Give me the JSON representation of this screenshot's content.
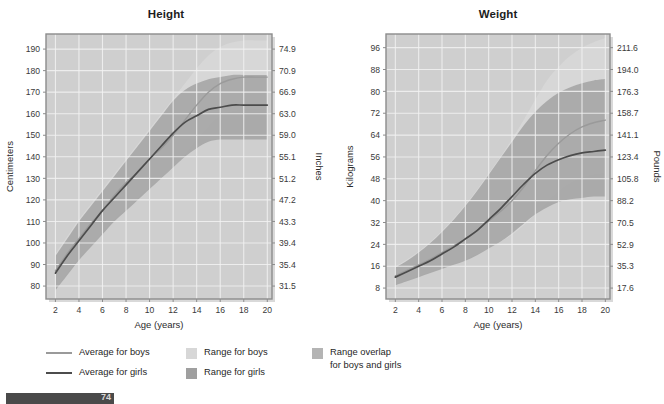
{
  "figure": {
    "background": "#ffffff",
    "plot_bg": "#cfcfcf",
    "grid_color": "#f2f2f2",
    "frame_color": "#8c8c8c",
    "boys_line_color": "#9a9a9a",
    "girls_line_color": "#4c4c4c",
    "boys_range_color": "#d7d7d7",
    "girls_range_color": "#9f9f9f",
    "overlap_color": "#b4b4b4"
  },
  "panels": [
    {
      "id": "height",
      "title": "Height",
      "x_label": "Age (years)",
      "y_left_label": "Centimeters",
      "y_right_label": "Inches"
    },
    {
      "id": "weight",
      "title": "Weight",
      "x_label": "Age (years)",
      "y_left_label": "Kilograms",
      "y_right_label": "Pounds"
    }
  ],
  "legend": {
    "lines": [
      {
        "label": "Average for boys",
        "color": "#9a9a9a",
        "marker": "line"
      },
      {
        "label": "Average for girls",
        "color": "#4c4c4c",
        "marker": "line"
      }
    ],
    "ranges": [
      {
        "label": "Range for boys",
        "color": "#d7d7d7",
        "marker": "box"
      },
      {
        "label": "Range for girls",
        "color": "#9f9f9f",
        "marker": "box"
      }
    ],
    "overlap": [
      {
        "label": "Range overlap\nfor boys and girls",
        "color": "#b4b4b4",
        "marker": "box"
      }
    ]
  },
  "footer": {
    "page_number": "74"
  },
  "chart_data": [
    {
      "type": "area",
      "id": "height",
      "title": "Height",
      "xlabel": "Age (years)",
      "ylabel": "Centimeters",
      "ylabel_right": "Inches",
      "grid": true,
      "legend_position": "below-figure",
      "xlim": [
        1.2,
        20.4
      ],
      "ylim": [
        74,
        197
      ],
      "x_ticks": [
        2,
        4,
        6,
        8,
        10,
        12,
        14,
        16,
        18,
        20
      ],
      "y_ticks_left": [
        80,
        90,
        100,
        110,
        120,
        130,
        140,
        150,
        160,
        170,
        180,
        190
      ],
      "y_ticks_right_values": [
        80,
        90,
        100,
        110,
        120,
        130,
        140,
        150,
        160,
        170,
        180,
        190
      ],
      "y_ticks_right_labels": [
        "31.5",
        "35.4",
        "39.4",
        "43.3",
        "47.2",
        "51.2",
        "55.1",
        "59.0",
        "63.0",
        "66.9",
        "70.9",
        "74.9"
      ],
      "x": [
        2,
        3,
        4,
        5,
        6,
        7,
        8,
        9,
        10,
        11,
        12,
        13,
        14,
        15,
        16,
        17,
        18,
        19,
        20
      ],
      "series": [
        {
          "name": "Average for boys",
          "kind": "line",
          "color": "#9a9a9a",
          "values": [
            87,
            95,
            102,
            109,
            115,
            122,
            128,
            133,
            139,
            144,
            150,
            157,
            164,
            170,
            174,
            176,
            177,
            177,
            177
          ]
        },
        {
          "name": "Average for girls",
          "kind": "line",
          "color": "#4c4c4c",
          "values": [
            86,
            94,
            101,
            108,
            115,
            121,
            127,
            133,
            139,
            145,
            151,
            156,
            159,
            162,
            163,
            164,
            164,
            164,
            164
          ]
        },
        {
          "name": "Range for boys",
          "kind": "band",
          "color": "#d7d7d7",
          "lower": [
            79,
            86,
            93,
            99,
            105,
            111,
            116,
            121,
            126,
            130,
            135,
            141,
            148,
            154,
            159,
            161,
            162,
            162,
            162
          ],
          "upper": [
            95,
            103,
            111,
            118,
            125,
            132,
            139,
            146,
            153,
            160,
            167,
            174,
            181,
            187,
            191,
            193,
            194,
            194,
            194
          ]
        },
        {
          "name": "Range for girls",
          "kind": "band",
          "color": "#9f9f9f",
          "lower": [
            78,
            85,
            92,
            98,
            104,
            110,
            115,
            120,
            125,
            130,
            135,
            140,
            144,
            147,
            148,
            148,
            148,
            148,
            148
          ],
          "upper": [
            94,
            102,
            110,
            117,
            124,
            131,
            138,
            145,
            152,
            159,
            166,
            171,
            174,
            176,
            177,
            178,
            178,
            178,
            178
          ]
        }
      ]
    },
    {
      "type": "area",
      "id": "weight",
      "title": "Weight",
      "xlabel": "Age (years)",
      "ylabel": "Kilograms",
      "ylabel_right": "Pounds",
      "grid": true,
      "legend_position": "below-figure",
      "xlim": [
        1.2,
        20.4
      ],
      "ylim": [
        4,
        101
      ],
      "x_ticks": [
        2,
        4,
        6,
        8,
        10,
        12,
        14,
        16,
        18,
        20
      ],
      "y_ticks_left": [
        8,
        16,
        24,
        32,
        40,
        48,
        56,
        64,
        72,
        80,
        88,
        96
      ],
      "y_ticks_right_values": [
        8,
        16,
        24,
        32,
        40,
        48,
        56,
        64,
        72,
        80,
        88,
        96
      ],
      "y_ticks_right_labels": [
        "17.6",
        "35.3",
        "52.9",
        "70.5",
        "88.2",
        "105.8",
        "123.4",
        "141.1",
        "158.7",
        "176.3",
        "194.0",
        "211.6"
      ],
      "x": [
        2,
        3,
        4,
        5,
        6,
        7,
        8,
        9,
        10,
        11,
        12,
        13,
        14,
        15,
        16,
        17,
        18,
        19,
        20
      ],
      "series": [
        {
          "name": "Average for boys",
          "kind": "line",
          "color": "#9a9a9a",
          "values": [
            12.5,
            14.5,
            16.5,
            18.5,
            21,
            23.5,
            26,
            29,
            32.5,
            36,
            40,
            45,
            51,
            56.5,
            61,
            64.5,
            67,
            68.5,
            69.5
          ]
        },
        {
          "name": "Average for girls",
          "kind": "line",
          "color": "#4c4c4c",
          "values": [
            12,
            14,
            16,
            18,
            20.5,
            23,
            26,
            29,
            33,
            37,
            41.5,
            46,
            50,
            53,
            55,
            56.5,
            57.5,
            58,
            58.5
          ]
        },
        {
          "name": "Range for boys",
          "kind": "band",
          "color": "#d7d7d7",
          "lower": [
            9.5,
            11,
            12.5,
            14,
            15.5,
            17,
            18.5,
            20.5,
            22.5,
            25,
            27.5,
            31,
            35,
            39.5,
            43.5,
            46.5,
            48.5,
            49.5,
            50
          ],
          "upper": [
            16,
            18.5,
            21.5,
            25,
            29,
            33.5,
            38.5,
            44,
            50,
            56,
            62.5,
            69.5,
            77,
            84,
            89,
            93,
            96,
            98,
            99.5
          ]
        },
        {
          "name": "Range for girls",
          "kind": "band",
          "color": "#9f9f9f",
          "lower": [
            9,
            10.5,
            12,
            13.5,
            15,
            16.5,
            18,
            20,
            22.5,
            25,
            28,
            31.5,
            35,
            37.5,
            39.5,
            40.5,
            41,
            41.5,
            41.5
          ],
          "upper": [
            15.5,
            18,
            21,
            24.5,
            28.5,
            33,
            38,
            43.5,
            49.5,
            55.5,
            61.5,
            67.5,
            72.5,
            76.5,
            79.5,
            81.5,
            83,
            84,
            84.5
          ]
        }
      ]
    }
  ]
}
